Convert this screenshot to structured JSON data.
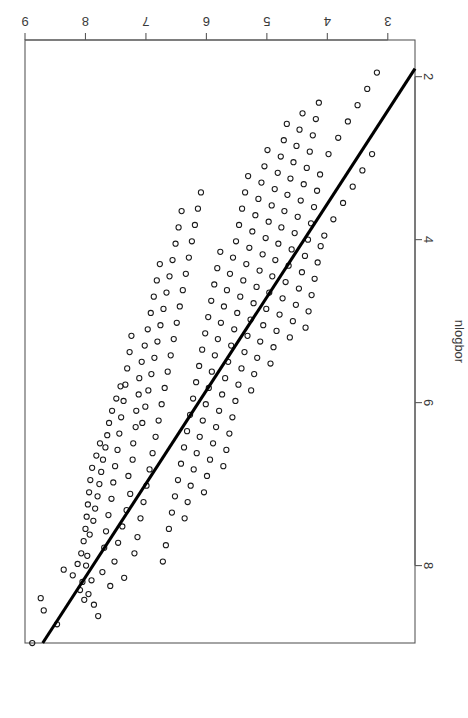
{
  "figure": {
    "rotation_degrees": 180,
    "background_color": "#ffffff",
    "frame_color": "#595959",
    "point_color": "#1a1a1a",
    "line_color": "#000000"
  },
  "chart_data": {
    "type": "scatter",
    "title": "",
    "subtitle": "",
    "xlabel": "fit",
    "ylabel": "nlogbor",
    "xlim": [
      2.55,
      9.0
    ],
    "ylim": [
      1.55,
      8.95
    ],
    "xticks": [
      3,
      4,
      5,
      6,
      7,
      8,
      9
    ],
    "yticks": [
      2,
      4,
      6,
      8
    ],
    "xtick_labels": [
      "3",
      "4",
      "5",
      "6",
      "7",
      "8",
      "9"
    ],
    "ytick_labels": [
      "2",
      "4",
      "6",
      "8"
    ],
    "grid": false,
    "legend": null,
    "legend_position": "none",
    "annotations": [],
    "n_points": 262,
    "series": [
      {
        "name": "nlogbor vs fit",
        "marker": "open-circle",
        "marker_size": 2.6,
        "x": [
          8.88,
          8.74,
          8.69,
          8.47,
          8.36,
          8.21,
          8.13,
          8.09,
          8.07,
          8.05,
          8.03,
          8.02,
          8.0,
          7.99,
          7.98,
          7.97,
          7.96,
          7.95,
          7.94,
          7.93,
          7.92,
          7.9,
          7.89,
          7.87,
          7.86,
          7.84,
          7.82,
          7.8,
          7.79,
          7.77,
          7.76,
          7.74,
          7.72,
          7.71,
          7.69,
          7.67,
          7.66,
          7.64,
          7.62,
          7.61,
          7.59,
          7.57,
          7.56,
          7.54,
          7.52,
          7.51,
          7.49,
          7.47,
          7.46,
          7.44,
          7.42,
          7.41,
          7.39,
          7.37,
          7.36,
          7.34,
          7.32,
          7.31,
          7.29,
          7.27,
          7.26,
          7.24,
          7.22,
          7.21,
          7.19,
          7.17,
          7.16,
          7.14,
          7.12,
          7.11,
          7.09,
          7.07,
          7.06,
          7.04,
          7.02,
          7.01,
          6.99,
          6.97,
          6.96,
          6.94,
          6.92,
          6.91,
          6.89,
          6.87,
          6.86,
          6.84,
          6.82,
          6.81,
          6.79,
          6.77,
          6.76,
          6.74,
          6.72,
          6.71,
          6.69,
          6.67,
          6.66,
          6.64,
          6.62,
          6.61,
          6.59,
          6.57,
          6.56,
          6.54,
          6.52,
          6.51,
          6.49,
          6.47,
          6.46,
          6.44,
          6.42,
          6.41,
          6.39,
          6.37,
          6.36,
          6.34,
          6.32,
          6.31,
          6.29,
          6.27,
          6.26,
          6.24,
          6.22,
          6.21,
          6.19,
          6.17,
          6.16,
          6.14,
          6.12,
          6.11,
          6.09,
          6.07,
          6.06,
          6.04,
          6.02,
          6.01,
          5.99,
          5.97,
          5.96,
          5.94,
          5.92,
          5.91,
          5.89,
          5.87,
          5.86,
          5.84,
          5.82,
          5.81,
          5.79,
          5.77,
          5.76,
          5.74,
          5.72,
          5.71,
          5.69,
          5.67,
          5.66,
          5.64,
          5.62,
          5.61,
          5.59,
          5.57,
          5.56,
          5.54,
          5.52,
          5.51,
          5.49,
          5.47,
          5.46,
          5.44,
          5.42,
          5.41,
          5.39,
          5.37,
          5.36,
          5.34,
          5.32,
          5.31,
          5.29,
          5.27,
          5.26,
          5.24,
          5.22,
          5.21,
          5.19,
          5.17,
          5.16,
          5.14,
          5.12,
          5.11,
          5.09,
          5.07,
          5.06,
          5.04,
          5.02,
          5.01,
          4.99,
          4.97,
          4.96,
          4.94,
          4.92,
          4.91,
          4.89,
          4.87,
          4.86,
          4.84,
          4.82,
          4.81,
          4.79,
          4.77,
          4.76,
          4.74,
          4.72,
          4.71,
          4.69,
          4.67,
          4.66,
          4.64,
          4.62,
          4.61,
          4.59,
          4.57,
          4.56,
          4.54,
          4.52,
          4.51,
          4.49,
          4.47,
          4.46,
          4.44,
          4.42,
          4.41,
          4.39,
          4.37,
          4.36,
          4.34,
          4.32,
          4.31,
          4.29,
          4.27,
          4.26,
          4.24,
          4.22,
          4.21,
          4.19,
          4.17,
          4.16,
          4.14,
          4.12,
          4.11,
          4.05,
          3.98,
          3.9,
          3.82,
          3.74,
          3.66,
          3.58,
          3.5,
          3.42,
          3.34,
          3.26,
          3.18
        ],
        "y": [
          8.95,
          8.4,
          8.55,
          8.72,
          8.05,
          8.12,
          7.98,
          8.3,
          7.85,
          8.2,
          7.7,
          8.42,
          7.55,
          8.0,
          7.4,
          7.88,
          7.25,
          8.35,
          7.1,
          7.62,
          6.95,
          8.18,
          6.8,
          7.45,
          8.48,
          7.3,
          6.65,
          7.15,
          8.62,
          7.0,
          6.5,
          6.85,
          8.08,
          6.7,
          7.78,
          6.55,
          7.58,
          6.4,
          7.38,
          6.25,
          8.25,
          7.18,
          6.1,
          6.98,
          7.95,
          6.78,
          5.95,
          6.58,
          7.72,
          6.38,
          5.8,
          6.18,
          7.52,
          5.98,
          8.15,
          5.78,
          7.32,
          5.58,
          6.9,
          5.38,
          7.12,
          5.18,
          6.7,
          6.5,
          7.85,
          6.3,
          6.1,
          7.65,
          5.9,
          5.7,
          7.42,
          5.5,
          6.25,
          7.22,
          5.3,
          6.05,
          7.02,
          5.1,
          5.85,
          6.82,
          4.9,
          5.65,
          6.62,
          4.7,
          5.45,
          6.42,
          4.5,
          5.25,
          6.22,
          4.3,
          5.05,
          6.02,
          7.95,
          4.85,
          5.82,
          7.75,
          4.65,
          5.62,
          7.55,
          4.45,
          5.42,
          7.35,
          4.25,
          5.22,
          7.15,
          4.05,
          5.02,
          6.95,
          3.85,
          4.82,
          6.75,
          3.65,
          4.62,
          6.55,
          7.42,
          4.42,
          6.35,
          7.22,
          4.22,
          6.15,
          7.02,
          4.02,
          5.95,
          6.82,
          3.82,
          5.75,
          6.62,
          3.62,
          5.55,
          6.42,
          3.42,
          5.35,
          6.22,
          7.1,
          5.15,
          6.02,
          6.9,
          4.95,
          5.82,
          6.7,
          4.75,
          5.62,
          6.5,
          4.55,
          5.42,
          6.3,
          4.35,
          5.22,
          6.1,
          4.15,
          5.02,
          5.9,
          6.78,
          4.82,
          5.7,
          6.58,
          4.62,
          5.5,
          6.38,
          4.42,
          5.3,
          6.18,
          4.22,
          5.1,
          5.98,
          4.02,
          4.9,
          5.78,
          3.82,
          4.7,
          5.58,
          3.62,
          4.5,
          5.38,
          3.42,
          4.3,
          5.18,
          3.22,
          4.1,
          4.98,
          5.85,
          3.9,
          4.78,
          5.65,
          3.7,
          4.58,
          5.45,
          3.5,
          4.38,
          5.25,
          3.3,
          4.18,
          5.05,
          3.1,
          3.98,
          4.85,
          2.9,
          3.78,
          4.65,
          5.52,
          3.58,
          4.45,
          5.32,
          3.38,
          4.25,
          5.12,
          3.18,
          4.05,
          4.92,
          2.98,
          3.85,
          4.72,
          2.78,
          3.65,
          4.52,
          2.58,
          3.45,
          4.32,
          5.2,
          3.25,
          4.12,
          5.0,
          3.05,
          3.92,
          4.8,
          2.85,
          3.72,
          4.6,
          2.65,
          3.52,
          4.4,
          2.45,
          3.32,
          4.2,
          5.08,
          3.12,
          4.0,
          4.88,
          2.92,
          3.8,
          4.68,
          2.72,
          3.6,
          4.48,
          2.52,
          3.4,
          4.28,
          2.32,
          3.2,
          4.08,
          3.95,
          2.95,
          3.75,
          2.75,
          3.55,
          2.55,
          3.35,
          2.35,
          3.15,
          2.15,
          2.95,
          1.95
        ]
      }
    ],
    "fit_line": {
      "name": "reference-line",
      "type": "line",
      "x": [
        2.2,
        9.1
      ],
      "y": [
        1.5,
        9.4
      ],
      "slope": 1.145,
      "intercept": -1.02,
      "width": 3.1,
      "color": "#000000"
    }
  }
}
